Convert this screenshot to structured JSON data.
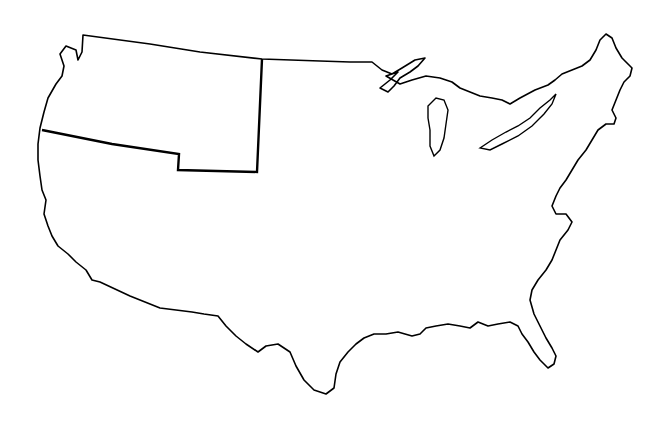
{
  "map": {
    "subject": "United States outline map",
    "highlighted_region": "Oregon Country",
    "stroke_color": "#000000",
    "background": "#ffffff"
  }
}
